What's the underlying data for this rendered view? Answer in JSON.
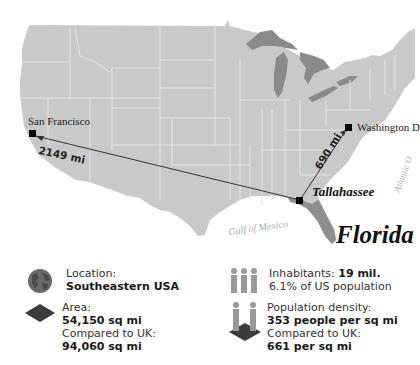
{
  "map": {
    "state_title": "Florida",
    "capital": "Tallahassee",
    "cities": [
      {
        "name": "San Francisco"
      },
      {
        "name": "Washington D"
      }
    ],
    "distances": [
      {
        "label": "2149 mi",
        "from": "Tallahassee",
        "to": "San Francisco"
      },
      {
        "label": "690 mi",
        "from": "Tallahassee",
        "to": "Washington D"
      }
    ],
    "water_labels": {
      "gulf": "Gulf of Mexico",
      "atlantic": "Atlantic O"
    },
    "colors": {
      "land": "#c9c9c9",
      "highlight_state": "#8e8e8e",
      "lakes": "#8a8a8a",
      "state_borders": "#e6e6e6",
      "water": "#ffffff"
    }
  },
  "facts": {
    "location": {
      "label": "Location:",
      "value": "Southeastern USA",
      "icon": "globe-icon"
    },
    "area": {
      "label": "Area:",
      "value": "54,150 sq mi",
      "compare_label": "Compared to UK:",
      "compare_value": "94,060 sq mi",
      "icon": "area-diamond-icon"
    },
    "inhabitants": {
      "label": "Inhabitants: ",
      "value": "19 mil.",
      "sub": "6.1% of US population",
      "icon": "people-icon"
    },
    "density": {
      "label": "Population density:",
      "value": "353 people per sq mi",
      "compare_label": "Compared to UK:",
      "compare_value": "661 per sq mi",
      "icon": "density-icon"
    }
  }
}
